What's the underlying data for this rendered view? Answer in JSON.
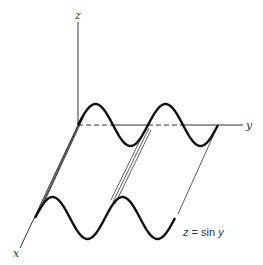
{
  "figure": {
    "axes": {
      "z_label": "z",
      "y_label": "y",
      "x_label": "x"
    },
    "equation_label": {
      "lhs": "z",
      "eq": " = sin ",
      "var": "y"
    }
  },
  "geometry": {
    "origin": [
      78,
      125
    ],
    "x_axis_end": [
      20,
      248
    ],
    "z_axis_top": [
      78,
      22
    ],
    "y_axis_end": [
      243,
      125
    ],
    "front_offset": [
      -43,
      93
    ],
    "amplitude": 21,
    "period_px": 70,
    "periods": 2
  }
}
